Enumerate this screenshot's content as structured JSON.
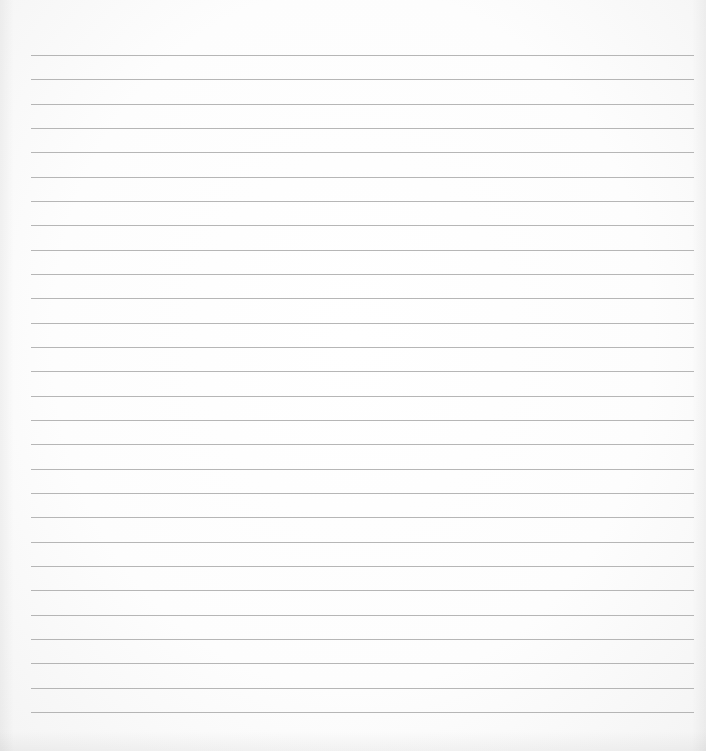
{
  "document": {
    "type": "lined-paper",
    "background_color": "#fdfdfd",
    "rule_color": "#a9a9a9",
    "rule_count": 28,
    "first_rule_y": 55,
    "rule_spacing": 24.33,
    "rule_left": 31,
    "rule_right": 694,
    "text_content": []
  }
}
